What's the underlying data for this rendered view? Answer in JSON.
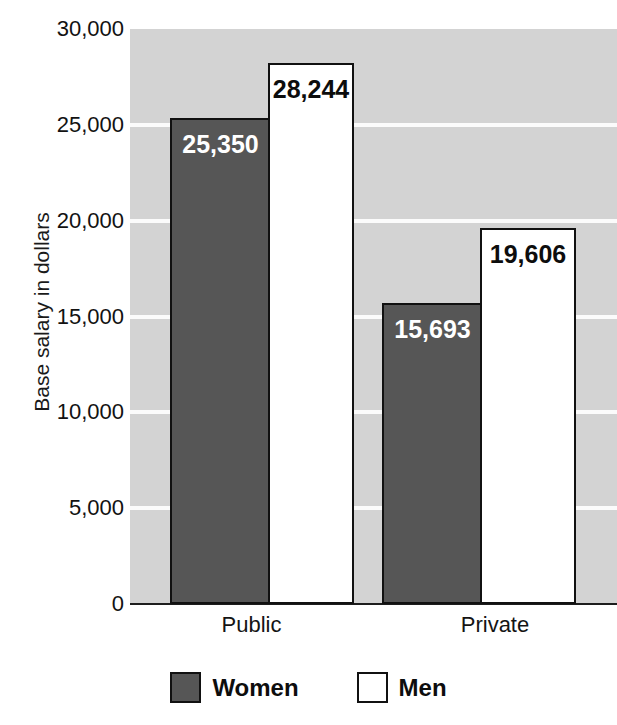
{
  "chart_data": {
    "type": "bar",
    "title": "",
    "xlabel": "",
    "ylabel": "Base salary in dollars",
    "categories": [
      "Public",
      "Private"
    ],
    "series": [
      {
        "name": "Women",
        "values": [
          25350,
          28244
        ],
        "color": "#565656"
      },
      {
        "name": "Men",
        "values": [
          15693,
          19606
        ],
        "color": "#ffffff"
      }
    ],
    "grouped_values": [
      {
        "category": "Public",
        "women": 25350,
        "men": 28244
      },
      {
        "category": "Private",
        "women": 15693,
        "men": 19606
      }
    ],
    "value_labels": [
      "25,350",
      "28,244",
      "15,693",
      "19,606"
    ],
    "ylim": [
      0,
      30000
    ],
    "ytick_values": [
      30000,
      25000,
      20000,
      15000,
      10000,
      5000,
      0
    ],
    "ytick_labels": [
      "30,000",
      "25,000",
      "20,000",
      "15,000",
      "10,000",
      "5,000",
      "0"
    ],
    "grid": true,
    "grid_color": "#fbfbfb",
    "plot_background": "#d3d3d3",
    "legend_position": "bottom"
  },
  "legend": {
    "items": [
      {
        "label": "Women",
        "swatch": "dark-gray-swatch"
      },
      {
        "label": "Men",
        "swatch": "white-swatch"
      }
    ]
  },
  "bars": [
    {
      "group": "Public",
      "series": "Women",
      "label": "25,350",
      "value": 25350
    },
    {
      "group": "Public",
      "series": "Men",
      "label": "28,244",
      "value": 28244
    },
    {
      "group": "Private",
      "series": "Women",
      "label": "15,693",
      "value": 15693
    },
    {
      "group": "Private",
      "series": "Men",
      "label": "19,606",
      "value": 19606
    }
  ]
}
